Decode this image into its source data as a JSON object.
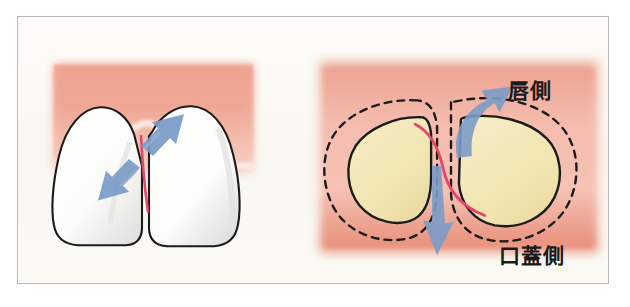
{
  "figure": {
    "domain": "dental-anatomy-illustration",
    "title": "",
    "frame_border_color": "#b9b9b9",
    "background_color": "#fbfaf6"
  },
  "palette": {
    "gingiva_pink": "#f0a593",
    "gingiva_pink_light": "#f5c3b6",
    "gingiva_pink_deep": "#e8917c",
    "tooth_enamel_white": "#fdfdfb",
    "tooth_enamel_shadow": "#dcdcd8",
    "tooth_dentin_cream": "#f2e6b4",
    "tooth_dentin_shadow": "#e6d79d",
    "outline_black": "#1a1a1a",
    "fiber_red": "#e4476a",
    "arrow_blue": "#7b9bc6",
    "arrow_blue_dark": "#6787b5"
  },
  "panels": [
    {
      "id": "frontal-view",
      "name": "frontal-incisor-view",
      "description": "Two adjacent incisors seen from the front with gingiva above and interdental papilla",
      "elements": {
        "gingiva": "gingiva-block",
        "teeth": [
          "left-incisor",
          "right-incisor"
        ],
        "fiber": "transseptal-fiber-red-line",
        "arrows": [
          "arrow-up-right",
          "arrow-down-left"
        ]
      }
    },
    {
      "id": "cross-section-view",
      "name": "cross-section-view",
      "description": "Horizontal cross-section through two teeth showing dentin cores, dashed gingival contour, crossing fiber and directional arrows",
      "elements": {
        "gingiva": "gingiva-block",
        "teeth": [
          "left-tooth-section",
          "right-tooth-section"
        ],
        "dashed_contour": "gingival-contour-dashed",
        "fiber": "transseptal-fiber-red-line",
        "arrows": [
          "arrow-curved-up-right",
          "arrow-straight-down"
        ]
      }
    }
  ],
  "labels": {
    "labial": "唇側",
    "palatal": "口蓋側"
  },
  "annotations": {
    "fiber_color_note": "#e4476a",
    "arrow_color_note": "#7b9bc6"
  }
}
